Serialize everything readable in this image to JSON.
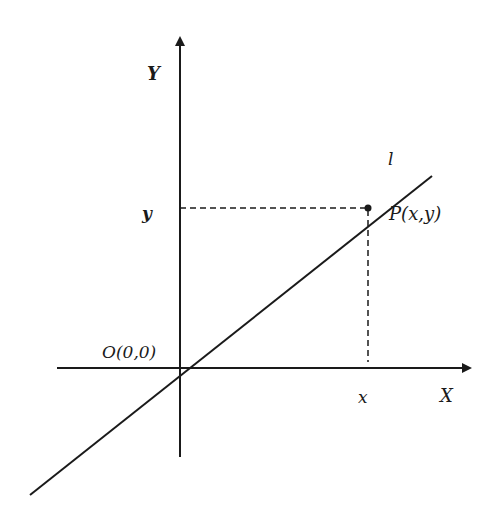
{
  "diagram": {
    "axes": {
      "x_label": "X",
      "y_label": "Y",
      "origin_label": "O(0,0)"
    },
    "line": {
      "label": "l"
    },
    "point": {
      "label": "P(x,y)",
      "x_label": "x",
      "y_label": "y"
    },
    "colors": {
      "ink": "#1a1a1a",
      "background": "#ffffff"
    }
  }
}
